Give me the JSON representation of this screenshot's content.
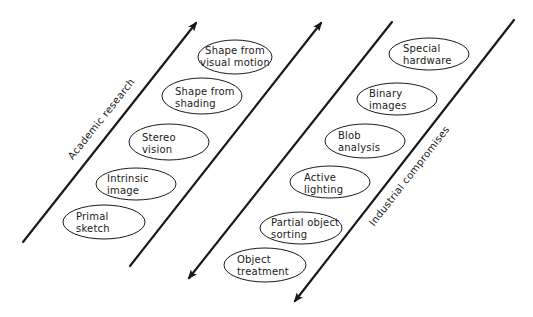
{
  "diagram": {
    "colors": {
      "ink": "#1a1a1a",
      "background": "#ffffff"
    },
    "bands": [
      {
        "label": "Academic research",
        "direction": "up",
        "nodes": [
          {
            "line1": "Shape from",
            "line2": "visual motion"
          },
          {
            "line1": "Shape from",
            "line2": "shading"
          },
          {
            "line1": "Stereo",
            "line2": "vision"
          },
          {
            "line1": "Intrinsic",
            "line2": "image"
          },
          {
            "line1": "Primal",
            "line2": "sketch"
          }
        ]
      },
      {
        "label": "Industrial compromises",
        "direction": "down",
        "nodes": [
          {
            "line1": "Special",
            "line2": "hardware"
          },
          {
            "line1": "Binary",
            "line2": "images"
          },
          {
            "line1": "Blob",
            "line2": "analysis"
          },
          {
            "line1": "Active",
            "line2": "lighting"
          },
          {
            "line1": "Partial object",
            "line2": "sorting"
          },
          {
            "line1": "Object",
            "line2": "treatment"
          }
        ]
      }
    ]
  }
}
